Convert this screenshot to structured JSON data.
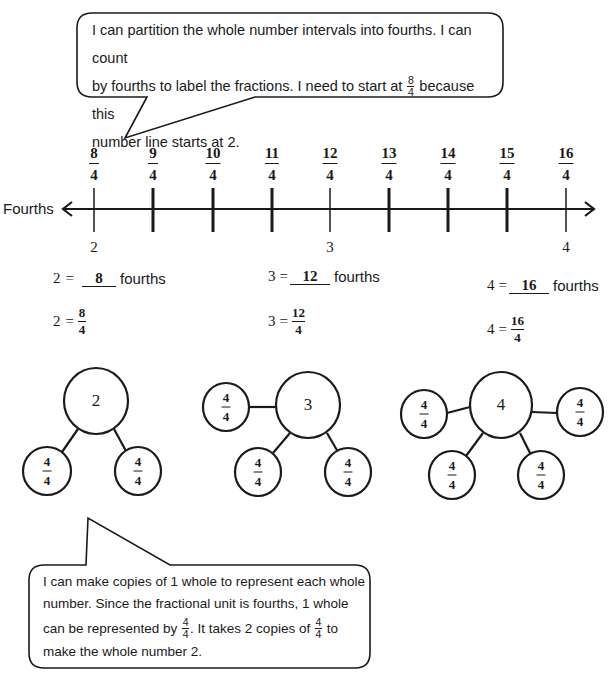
{
  "top_bubble": {
    "line1": "I can partition the whole number intervals into fourths.  I can count",
    "line2_before": "by fourths to label the fractions.  I need to start at ",
    "line2_frac_num": "8",
    "line2_frac_den": "4",
    "line2_after": " because this",
    "line3": "number line starts at 2."
  },
  "number_line": {
    "label": "Fourths",
    "ticks": [
      {
        "num": "8",
        "den": "4",
        "x": 94,
        "whole": "2"
      },
      {
        "num": "9",
        "den": "4",
        "x": 153,
        "whole": ""
      },
      {
        "num": "10",
        "den": "4",
        "x": 213,
        "whole": ""
      },
      {
        "num": "11",
        "den": "4",
        "x": 272,
        "whole": ""
      },
      {
        "num": "12",
        "den": "4",
        "x": 330,
        "whole": "3"
      },
      {
        "num": "13",
        "den": "4",
        "x": 389,
        "whole": ""
      },
      {
        "num": "14",
        "den": "4",
        "x": 448,
        "whole": ""
      },
      {
        "num": "15",
        "den": "4",
        "x": 507,
        "whole": ""
      },
      {
        "num": "16",
        "den": "4",
        "x": 566,
        "whole": "4"
      }
    ]
  },
  "equations": [
    {
      "whole": "2",
      "eq": "=",
      "blank_value": "8",
      "unit": "fourths",
      "frac_num": "8",
      "frac_den": "4"
    },
    {
      "whole": "3",
      "eq": "=",
      "blank_value": "12",
      "unit": "fourths",
      "frac_num": "12",
      "frac_den": "4"
    },
    {
      "whole": "4",
      "eq": "=",
      "blank_value": "16",
      "unit": "fourths",
      "frac_num": "16",
      "frac_den": "4"
    }
  ],
  "number_bonds": [
    {
      "whole": "2",
      "part_num": "4",
      "part_den": "4",
      "part_count": 2
    },
    {
      "whole": "3",
      "part_num": "4",
      "part_den": "4",
      "part_count": 3
    },
    {
      "whole": "4",
      "part_num": "4",
      "part_den": "4",
      "part_count": 4
    }
  ],
  "bottom_bubble": {
    "line1": "I can make copies of 1 whole to represent each whole",
    "line2": "number.  Since the fractional unit is fourths, 1 whole",
    "line3_a": "can be represented by ",
    "line3_frac1_num": "4",
    "line3_frac1_den": "4",
    "line3_b": ".  It takes 2 copies of ",
    "line3_frac2_num": "4",
    "line3_frac2_den": "4",
    "line3_c": " to",
    "line4": "make the whole number 2."
  }
}
